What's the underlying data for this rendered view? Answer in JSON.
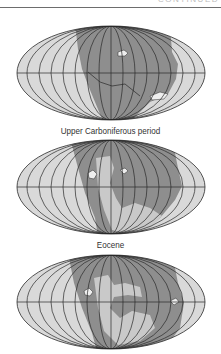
{
  "header": {
    "running_head": "CONTINUED"
  },
  "colors": {
    "ocean": "#d9d9d9",
    "land": "#8e8e8e",
    "land_light": "#c9c9c9",
    "grid": "#2a2a2a",
    "ice": "#eeeeee"
  },
  "maps": [
    {
      "caption": "Upper Carboniferous period"
    },
    {
      "caption": "Eocene"
    },
    {
      "caption": ""
    }
  ]
}
